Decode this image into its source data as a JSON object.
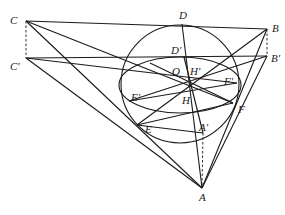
{
  "diagram": {
    "labels": {
      "C": "C",
      "C_prime": "C'",
      "B": "B",
      "B_prime": "B'",
      "D": "D",
      "D_prime": "D'",
      "O": "O",
      "H": "H",
      "H_prime": "H'",
      "E": "E",
      "E_prime": "E'",
      "F": "F",
      "F_prime": "F'",
      "A": "A",
      "A_prime": "A'"
    },
    "points": {
      "C": [
        26,
        21
      ],
      "C_prime": [
        26,
        58
      ],
      "B": [
        267,
        29
      ],
      "B_prime": [
        267,
        56
      ],
      "A": [
        202,
        188
      ],
      "A_prime": [
        203,
        133
      ],
      "D": [
        182,
        24
      ],
      "D_prime": [
        184,
        57
      ],
      "O": [
        181,
        84
      ],
      "H": [
        190,
        85
      ],
      "H_prime": [
        190,
        85
      ],
      "E": [
        137,
        125
      ],
      "E_prime": [
        129,
        101
      ],
      "F": [
        233,
        103
      ],
      "F_prime": [
        237,
        83
      ]
    },
    "circle": {
      "cx": 180,
      "cy": 84,
      "r": 59
    },
    "ellipse": {
      "cx": 180,
      "cy": 85,
      "rx": 61,
      "ry": 28
    },
    "stroke_color": "#1a1a1a"
  }
}
